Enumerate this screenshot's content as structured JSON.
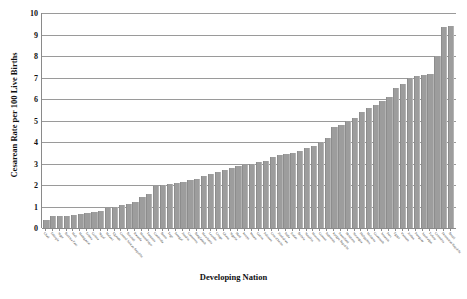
{
  "chart_data": {
    "type": "bar",
    "title": "",
    "xlabel": "Developing Nation",
    "ylabel": "Cesarean Rate per 100 Live Births",
    "ylim": [
      0,
      10
    ],
    "yticks": [
      0,
      1,
      2,
      3,
      4,
      5,
      6,
      7,
      8,
      9,
      10
    ],
    "grid": true,
    "legend": "none",
    "bar_color": "#9d9d9d",
    "categories": [
      "Chad",
      "Ethiopia",
      "Niger",
      "Burkina Faso",
      "Mali",
      "Madagascar",
      "Eritrea",
      "Guinea",
      "Nepal",
      "Malawi",
      "Uganda",
      "Central African Republic",
      "Burundi",
      "Rwanda",
      "Mozambique",
      "Tanzania",
      "Cambodia",
      "Benin",
      "Togo",
      "Senegal",
      "Zambia",
      "Cameroon",
      "Bangladesh",
      "Mauritania",
      "Lesotho",
      "Congo",
      "Ghana",
      "Nigeria",
      "Haiti",
      "Kenya",
      "Yemen",
      "Gabon",
      "Pakistan",
      "Cote d'Ivoire",
      "Zimbabwe",
      "India",
      "Sudan",
      "Bolivia",
      "Namibia",
      "Morocco",
      "Guyana",
      "Indonesia",
      "Kyrgyz Republic",
      "Swaziland",
      "Honduras",
      "Nicaragua",
      "Philippines",
      "Moldova",
      "Guatemala",
      "Armenia",
      "Peru",
      "Egypt",
      "Vietnam",
      "Jordan",
      "Paraguay",
      "Azerbaijan",
      "Turkey",
      "Colombia",
      "Dominican Republic",
      "Brazil"
    ],
    "values": [
      0.35,
      0.55,
      0.55,
      0.55,
      0.6,
      0.65,
      0.7,
      0.75,
      0.8,
      0.95,
      1.0,
      1.05,
      1.1,
      1.2,
      1.45,
      1.6,
      1.95,
      2.0,
      2.05,
      2.1,
      2.15,
      2.25,
      2.3,
      2.4,
      2.5,
      2.6,
      2.7,
      2.8,
      2.9,
      2.95,
      3.0,
      3.05,
      3.1,
      3.3,
      3.4,
      3.45,
      3.5,
      3.6,
      3.7,
      3.8,
      4.0,
      4.2,
      4.7,
      4.8,
      5.0,
      5.1,
      5.4,
      5.6,
      5.7,
      5.9,
      6.1,
      6.5,
      6.7,
      7.0,
      7.05,
      7.1,
      7.15,
      8.0,
      9.35,
      9.4
    ]
  }
}
